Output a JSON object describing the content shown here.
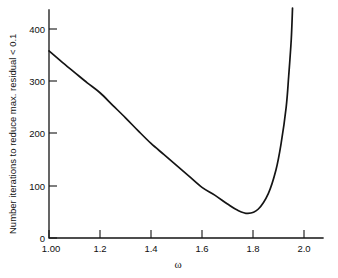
{
  "chart_data": {
    "type": "line",
    "title": "",
    "subtitle": "",
    "xlabel": "ω",
    "ylabel": "Number iterations to reduce max. residual < 0.1",
    "xlim": [
      1.0,
      2.08
    ],
    "ylim": [
      0,
      440
    ],
    "grid": false,
    "legend": null,
    "xticks": [
      1.0,
      1.2,
      1.4,
      1.6,
      1.8,
      2.0
    ],
    "xticklabels": [
      "1.00",
      "1.2",
      "1.4",
      "1.6",
      "1.8",
      "2.0"
    ],
    "yticks": [
      0,
      100,
      200,
      300,
      400
    ],
    "yticklabels": [
      "0",
      "100",
      "200",
      "300",
      "400"
    ],
    "series": [
      {
        "name": "iterations",
        "x": [
          1.0,
          1.05,
          1.1,
          1.15,
          1.2,
          1.25,
          1.3,
          1.35,
          1.4,
          1.45,
          1.5,
          1.55,
          1.6,
          1.65,
          1.7,
          1.74,
          1.78,
          1.82,
          1.86,
          1.89,
          1.91,
          1.93,
          1.94,
          1.95,
          1.955
        ],
        "y": [
          358,
          337,
          317,
          297,
          278,
          254,
          230,
          205,
          181,
          160,
          139,
          118,
          97,
          82,
          65,
          53,
          47,
          55,
          85,
          130,
          180,
          250,
          310,
          380,
          440
        ]
      }
    ],
    "annotations": {
      "minimum_value": 47,
      "minimum_omega": 1.78,
      "left_endpoint_value": 358
    },
    "colors": {
      "curve": "#141414",
      "axis": "#141414",
      "background": "#ffffff",
      "text": "#101010"
    }
  }
}
